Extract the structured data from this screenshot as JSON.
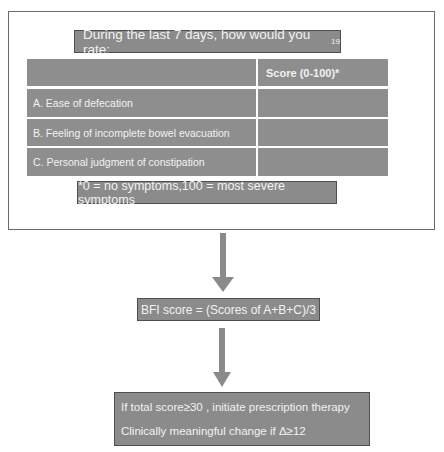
{
  "questionnaire": {
    "title": "During the last 7 days, how would you rate:",
    "title_superscript": "19",
    "table": {
      "headers": [
        "",
        "Score (0-100)*"
      ],
      "rows": [
        {
          "item": "A. Ease of defecation",
          "score": ""
        },
        {
          "item": "B. Feeling of incomplete bowel evacuation",
          "score": ""
        },
        {
          "item": "C. Personal judgment of constipation",
          "score": ""
        }
      ]
    },
    "footnote": "*0 = no symptoms,100 = most severe symptoms"
  },
  "formula": {
    "text": "BFI score = (Scores of A+B+C)/3"
  },
  "outcome": {
    "line1": "If total score≥30 , initiate prescription therapy",
    "line2": "Clinically meaningful change if Δ≥12"
  },
  "colors": {
    "box_fill": "#8b8b8b",
    "box_border": "#4f4f4f",
    "arrow": "#8a8a8a",
    "text": "#f2f2f2"
  }
}
